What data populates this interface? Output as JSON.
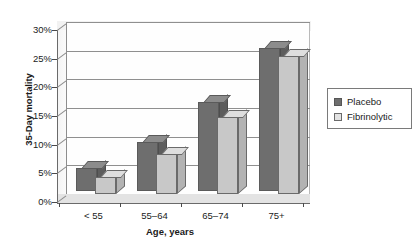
{
  "chart_data": {
    "type": "bar",
    "title": "",
    "xlabel": "Age, years",
    "ylabel": "35-Day mortality",
    "categories": [
      "< 55",
      "55–64",
      "65–74",
      "75+"
    ],
    "series": [
      {
        "name": "Placebo",
        "color": "#6e6e6e",
        "values": [
          4,
          8.5,
          15.5,
          25
        ]
      },
      {
        "name": "Fibrinolytic",
        "color": "#c8c8c8",
        "values": [
          3,
          7,
          13.5,
          24
        ]
      }
    ],
    "ylim": [
      0,
      30
    ],
    "ytick_values": [
      0,
      5,
      10,
      15,
      20,
      25,
      30
    ],
    "ytick_labels": [
      "0%",
      "5%",
      "10%",
      "15%",
      "20%",
      "25%",
      "30%"
    ],
    "grid": true,
    "legend_position": "right",
    "style": "3d-column"
  },
  "axes": {
    "y_title": "35-Day mortality",
    "x_title": "Age, years"
  },
  "legend": {
    "entries": [
      {
        "label": "Placebo",
        "swatch": "dark-gray-swatch"
      },
      {
        "label": "Fibrinolytic",
        "swatch": "light-gray-swatch"
      }
    ]
  }
}
